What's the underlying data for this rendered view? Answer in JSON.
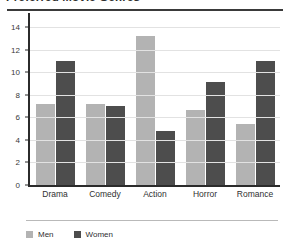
{
  "chart_data": {
    "type": "bar",
    "title": "Preferred Movie Genres",
    "xlabel": "",
    "ylabel": "",
    "ylim": [
      0,
      15
    ],
    "yticks": [
      0,
      2,
      4,
      6,
      8,
      10,
      12,
      14
    ],
    "grid": true,
    "legend_position": "bottom-left",
    "categories": [
      "Drama",
      "Comedy",
      "Action",
      "Horror",
      "Romance"
    ],
    "series": [
      {
        "name": "Men",
        "color": "#b3b3b3",
        "values": [
          7.2,
          7.2,
          13.2,
          6.7,
          5.4
        ]
      },
      {
        "name": "Women",
        "color": "#4d4d4d",
        "values": [
          11.0,
          7.0,
          4.8,
          9.1,
          11.0
        ]
      }
    ]
  }
}
